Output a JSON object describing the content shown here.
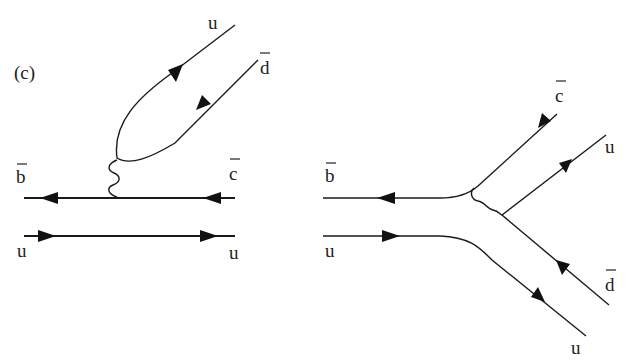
{
  "figure": {
    "panel_label": "(c)",
    "colors": {
      "line": "#1a1a1a",
      "background": "#ffffff"
    }
  },
  "left_diagram": {
    "name": "color-suppressed internal W emission",
    "labels": {
      "top_out_1": "u",
      "top_out_2": "d",
      "top_out_2_bar": true,
      "in_top": "b",
      "in_top_bar": true,
      "out_top": "c",
      "out_top_bar": true,
      "in_bottom": "u",
      "out_bottom": "u"
    },
    "propagators": [
      "b̄ line (arrow left)",
      "c̄ line (arrow left)",
      "u spectator (arrow right)",
      "W boson (wavy)",
      "u d̄ pair"
    ]
  },
  "right_diagram": {
    "name": "annihilation/exchange topology",
    "labels": {
      "in_top": "b",
      "in_top_bar": true,
      "in_bottom": "u",
      "out_1": "c",
      "out_1_bar": true,
      "out_2": "u",
      "out_3": "d",
      "out_3_bar": true,
      "out_4": "u"
    }
  }
}
